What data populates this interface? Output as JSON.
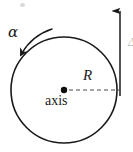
{
  "figure": {
    "type": "physics-diagram",
    "background_color": "#ffffff",
    "stroke_color": "#1a1a1a",
    "width": 133,
    "height": 152,
    "labels": {
      "alpha": "α",
      "radius": "R",
      "axis": "axis",
      "edge_fragment": "Δ"
    },
    "elements": {
      "circle": {
        "name": "disk-outline",
        "center_x": 64,
        "center_y": 90,
        "radius": 53,
        "stroke_width": 1.6,
        "fill": "none"
      },
      "center_dot": {
        "name": "rotation-axis-point",
        "cx": 64,
        "cy": 90,
        "r": 3.2
      },
      "radius_line": {
        "name": "radius-dashed-line",
        "x1": 68,
        "y1": 90,
        "x2": 120,
        "y2": 90,
        "dash": "4 3",
        "stroke_width": 1.3
      },
      "vertical_arrow": {
        "name": "tangential-velocity-arrow",
        "x": 120,
        "y_tail": 95,
        "y_head": 5,
        "direction": "up",
        "stroke_width": 1.6
      },
      "curved_arrow": {
        "name": "angular-acceleration-arrow",
        "direction": "counterclockwise",
        "arrowhead_at": "lower-left",
        "stroke_width": 1.5
      }
    }
  }
}
